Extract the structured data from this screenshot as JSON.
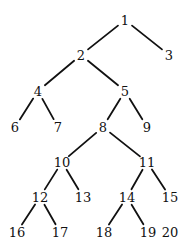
{
  "diagram": {
    "type": "tree",
    "nodes": [
      {
        "id": "1",
        "label": "1",
        "x": 125,
        "y": 20
      },
      {
        "id": "2",
        "label": "2",
        "x": 81,
        "y": 55
      },
      {
        "id": "3",
        "label": "3",
        "x": 169,
        "y": 55
      },
      {
        "id": "4",
        "label": "4",
        "x": 38,
        "y": 91
      },
      {
        "id": "5",
        "label": "5",
        "x": 125,
        "y": 91
      },
      {
        "id": "6",
        "label": "6",
        "x": 15,
        "y": 127
      },
      {
        "id": "7",
        "label": "7",
        "x": 58,
        "y": 127
      },
      {
        "id": "8",
        "label": "8",
        "x": 103,
        "y": 127
      },
      {
        "id": "9",
        "label": "9",
        "x": 147,
        "y": 127
      },
      {
        "id": "10",
        "label": "10",
        "x": 62,
        "y": 162
      },
      {
        "id": "11",
        "label": "11",
        "x": 147,
        "y": 162
      },
      {
        "id": "12",
        "label": "12",
        "x": 40,
        "y": 197
      },
      {
        "id": "13",
        "label": "13",
        "x": 83,
        "y": 197
      },
      {
        "id": "14",
        "label": "14",
        "x": 127,
        "y": 197
      },
      {
        "id": "15",
        "label": "15",
        "x": 170,
        "y": 197
      },
      {
        "id": "16",
        "label": "16",
        "x": 17,
        "y": 232
      },
      {
        "id": "17",
        "label": "17",
        "x": 60,
        "y": 232
      },
      {
        "id": "18",
        "label": "18",
        "x": 104,
        "y": 232
      },
      {
        "id": "19",
        "label": "19",
        "x": 148,
        "y": 232
      },
      {
        "id": "20",
        "label": "20",
        "x": 170,
        "y": 232
      }
    ],
    "edges": [
      [
        "1",
        "2"
      ],
      [
        "1",
        "3"
      ],
      [
        "2",
        "4"
      ],
      [
        "2",
        "5"
      ],
      [
        "4",
        "6"
      ],
      [
        "4",
        "7"
      ],
      [
        "5",
        "8"
      ],
      [
        "5",
        "9"
      ],
      [
        "8",
        "10"
      ],
      [
        "8",
        "11"
      ],
      [
        "10",
        "12"
      ],
      [
        "10",
        "13"
      ],
      [
        "11",
        "14"
      ],
      [
        "11",
        "15"
      ],
      [
        "12",
        "16"
      ],
      [
        "12",
        "17"
      ],
      [
        "14",
        "18"
      ],
      [
        "14",
        "19"
      ]
    ]
  }
}
